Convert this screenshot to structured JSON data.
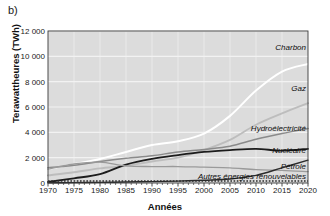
{
  "panel": {
    "label": "b)"
  },
  "axes": {
    "ylabel": "Terawattheures (TWh)",
    "xlabel": "Années",
    "yticks": [
      "0",
      "2 000",
      "4 000",
      "6 000",
      "8 000",
      "10 000",
      "12 000"
    ],
    "xticks": [
      "1970",
      "1975",
      "1980",
      "1985",
      "1990",
      "1995",
      "2000",
      "2005",
      "2010",
      "2015",
      "2020"
    ]
  },
  "labels": {
    "charbon": "Charbon",
    "gaz": "Gaz",
    "hydro": "Hydroélectricité",
    "nucleaire": "Nucléaire",
    "petrole": "Pétrole",
    "renouvelables": "Autres énergies renouvelables"
  },
  "colors": {
    "plot_background": "#dcdcdc",
    "gridline": "#f2f2f2",
    "charbon": "#ffffff",
    "gaz": "#bdbdbd",
    "hydro": "#8a8a8a",
    "nucleaire": "#1c1c1c",
    "petrole": "#9a9a9a",
    "renouvelables": "#2b2b2b",
    "axis": "#3a3a3a",
    "text": "#111111"
  },
  "chart_data": {
    "type": "line",
    "title": "",
    "xlabel": "Années",
    "ylabel": "Terawattheures (TWh)",
    "xlim": [
      1970,
      2020
    ],
    "ylim": [
      0,
      12000
    ],
    "yticks": [
      0,
      2000,
      4000,
      6000,
      8000,
      10000,
      12000
    ],
    "xticks": [
      1970,
      1975,
      1980,
      1985,
      1990,
      1995,
      2000,
      2005,
      2010,
      2015,
      2020
    ],
    "grid": true,
    "legend": "inline-right-labels",
    "x": [
      1970,
      1975,
      1980,
      1985,
      1990,
      1995,
      2000,
      2005,
      2010,
      2015,
      2020
    ],
    "series": [
      {
        "name": "Charbon",
        "color": "#ffffff",
        "values": [
          1100,
          1500,
          1900,
          2450,
          3000,
          3300,
          3900,
          5300,
          7300,
          8800,
          9400
        ]
      },
      {
        "name": "Gaz",
        "color": "#bdbdbd",
        "values": [
          600,
          850,
          1150,
          1350,
          1700,
          2000,
          2600,
          3400,
          4600,
          5500,
          6300
        ]
      },
      {
        "name": "Hydroélectricité",
        "color": "#8a8a8a",
        "values": [
          1200,
          1400,
          1700,
          1950,
          2150,
          2450,
          2650,
          2900,
          3450,
          3900,
          4300
        ]
      },
      {
        "name": "Nucléaire",
        "color": "#1c1c1c",
        "values": [
          80,
          370,
          700,
          1450,
          1900,
          2200,
          2450,
          2600,
          2700,
          2550,
          2700
        ]
      },
      {
        "name": "Pétrole",
        "color": "#9a9a9a",
        "values": [
          1100,
          1500,
          1650,
          1350,
          1300,
          1300,
          1250,
          1200,
          1050,
          1000,
          900
        ]
      },
      {
        "name": "Autres énergies renouvelables",
        "color": "#2b2b2b",
        "values": [
          20,
          30,
          50,
          80,
          110,
          150,
          220,
          320,
          600,
          1200,
          1800
        ]
      }
    ]
  }
}
